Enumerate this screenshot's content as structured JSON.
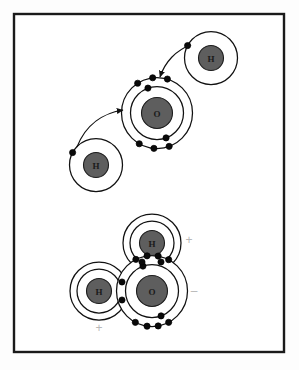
{
  "figure": {
    "background_color": "#fdfdfd",
    "frame": {
      "border_color": "#1a1a1a",
      "fill_color": "#ffffff",
      "x": 14,
      "y": 14,
      "width": 270,
      "height": 338,
      "stroke_width": 2.4
    }
  },
  "style": {
    "shell_stroke": "#111111",
    "shell_fill": "#ffffff",
    "nucleus_fill": "#5e5e5e",
    "nucleus_stroke": "#1c1c1c",
    "electron_fill": "#0a0a0a",
    "electron_stroke": "#000000",
    "arrow_color": "#111111",
    "charge_color": "#b8b8b8",
    "label_color": "#1a1a1a"
  },
  "panels": [
    {
      "id": "reactants",
      "name": "separate-atoms-panel",
      "caption": "Two hydrogen atoms and one oxygen atom before bonding"
    },
    {
      "id": "product",
      "name": "water-molecule-panel",
      "caption": "Water molecule with two shared electron pairs and partial charges"
    }
  ],
  "atoms": [
    {
      "id": "h-top-right",
      "name": "hydrogen-atom-top-right",
      "element": "H",
      "label": "H",
      "panel": "reactants",
      "cx": 211,
      "cy": 58,
      "nucleus_r": 12.5,
      "shells": [
        {
          "r": 26.5,
          "electrons": 1
        }
      ],
      "electron_positions": [
        {
          "angle": 208,
          "r": 26.5
        }
      ],
      "label_font_size": 9
    },
    {
      "id": "h-bottom-left",
      "name": "hydrogen-atom-left",
      "element": "H",
      "label": "H",
      "panel": "reactants",
      "cx": 96,
      "cy": 165,
      "nucleus_r": 12.5,
      "shells": [
        {
          "r": 26.5,
          "electrons": 1
        }
      ],
      "electron_positions": [
        {
          "angle": 208,
          "r": 26.5
        }
      ],
      "label_font_size": 9
    },
    {
      "id": "o-top",
      "name": "oxygen-atom-top",
      "element": "O",
      "label": "O",
      "panel": "reactants",
      "cx": 157,
      "cy": 113,
      "nucleus_r": 15.5,
      "shells": [
        {
          "r": 26.5,
          "electrons": 2
        },
        {
          "r": 35.5,
          "electrons": 6
        }
      ],
      "inner_electron_angles": [
        250,
        70
      ],
      "outer_electron_angles": [
        237,
        263,
        287,
        70,
        95,
        120
      ],
      "label_font_size": 9
    },
    {
      "id": "h-water-top",
      "name": "hydrogen-atom-water-top",
      "element": "H",
      "label": "H",
      "panel": "product",
      "cx": 152,
      "cy": 243,
      "nucleus_r": 12.5,
      "shells": [
        {
          "r": 22.0,
          "electrons": 0
        },
        {
          "r": 29.0,
          "electrons": 0
        }
      ],
      "label_font_size": 9
    },
    {
      "id": "h-water-left",
      "name": "hydrogen-atom-water-left",
      "element": "H",
      "label": "H",
      "panel": "product",
      "cx": 99,
      "cy": 291,
      "nucleus_r": 12.5,
      "shells": [
        {
          "r": 22.0,
          "electrons": 0
        },
        {
          "r": 29.0,
          "electrons": 0
        }
      ],
      "label_font_size": 9
    },
    {
      "id": "o-water",
      "name": "oxygen-atom-water",
      "element": "O",
      "label": "O",
      "panel": "product",
      "cx": 152,
      "cy": 291,
      "nucleus_r": 15.5,
      "shells": [
        {
          "r": 26.5,
          "electrons": 2
        },
        {
          "r": 35.5,
          "electrons": 8
        }
      ],
      "inner_electron_angles": [
        250,
        70
      ],
      "outer_electron_angles": [
        243,
        262,
        280,
        298,
        62,
        80,
        98,
        118
      ],
      "label_font_size": 9
    }
  ],
  "shared_pairs": [
    {
      "name": "shared-pair-oxygen-top-hydrogen",
      "description": "Electron pair shared between oxygen and the upper hydrogen",
      "electrons": [
        {
          "x": 142,
          "y": 262
        },
        {
          "x": 161,
          "y": 262
        }
      ]
    },
    {
      "name": "shared-pair-oxygen-left-hydrogen",
      "description": "Electron pair shared between oxygen and the left hydrogen",
      "electrons": [
        {
          "x": 122,
          "y": 282
        },
        {
          "x": 122,
          "y": 300
        }
      ]
    }
  ],
  "arrows": [
    {
      "name": "electron-transfer-arrow-top",
      "description": "Electron of the top-right hydrogen moving toward the oxygen outer shell",
      "path": "M 191,45 C 176,50 165,62 160,77",
      "from_atom": "h-top-right",
      "to_atom": "o-top"
    },
    {
      "name": "electron-transfer-arrow-left",
      "description": "Electron of the left hydrogen moving toward the oxygen outer shell",
      "path": "M 77,147 C 86,124 104,113 123,110",
      "from_atom": "h-bottom-left",
      "to_atom": "o-top"
    }
  ],
  "charges": [
    {
      "name": "partial-positive-charge-right",
      "symbol": "+",
      "x": 189,
      "y": 240,
      "font_size": 12,
      "meaning": "partial positive charge near hydrogen"
    },
    {
      "name": "partial-negative-charge",
      "symbol": "–",
      "x": 194,
      "y": 291,
      "font_size": 12,
      "meaning": "partial negative charge near oxygen"
    },
    {
      "name": "partial-positive-charge-bottom",
      "symbol": "+",
      "x": 99,
      "y": 328,
      "font_size": 12,
      "meaning": "partial positive charge near hydrogen"
    }
  ]
}
